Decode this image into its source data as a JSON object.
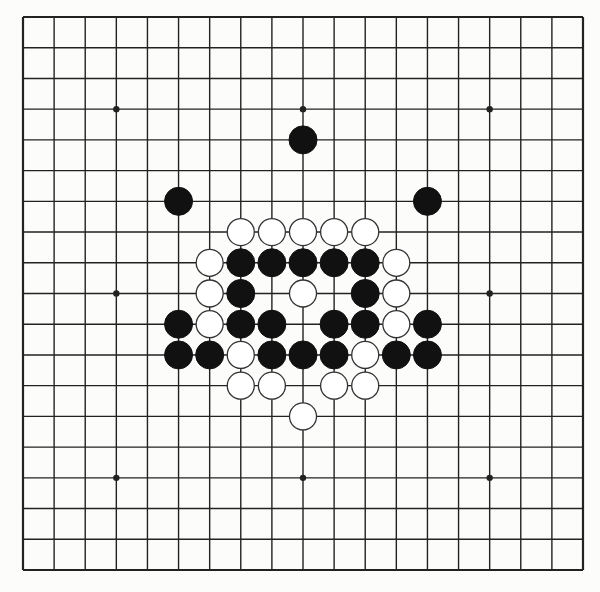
{
  "board": {
    "size": 19,
    "left": 23,
    "top": 17,
    "right": 583,
    "bottom": 570,
    "background": "#fcfcfb",
    "line_color": "#222222",
    "stone_black": "#111111",
    "stone_white": "#ffffff",
    "stone_outline": "#333333",
    "stone_radius": 14,
    "hoshi": [
      [
        3,
        3
      ],
      [
        9,
        3
      ],
      [
        15,
        3
      ],
      [
        3,
        9
      ],
      [
        9,
        9
      ],
      [
        15,
        9
      ],
      [
        3,
        15
      ],
      [
        9,
        15
      ],
      [
        15,
        15
      ]
    ]
  },
  "stones": {
    "black": [
      [
        9,
        4
      ],
      [
        5,
        6
      ],
      [
        13,
        6
      ],
      [
        7,
        8
      ],
      [
        8,
        8
      ],
      [
        9,
        8
      ],
      [
        10,
        8
      ],
      [
        11,
        8
      ],
      [
        7,
        9
      ],
      [
        11,
        9
      ],
      [
        5,
        10
      ],
      [
        7,
        10
      ],
      [
        8,
        10
      ],
      [
        10,
        10
      ],
      [
        11,
        10
      ],
      [
        13,
        10
      ],
      [
        5,
        11
      ],
      [
        6,
        11
      ],
      [
        8,
        11
      ],
      [
        9,
        11
      ],
      [
        10,
        11
      ],
      [
        12,
        11
      ],
      [
        13,
        11
      ]
    ],
    "white": [
      [
        7,
        7
      ],
      [
        8,
        7
      ],
      [
        9,
        7
      ],
      [
        10,
        7
      ],
      [
        11,
        7
      ],
      [
        6,
        8
      ],
      [
        12,
        8
      ],
      [
        6,
        9
      ],
      [
        9,
        9
      ],
      [
        12,
        9
      ],
      [
        6,
        10
      ],
      [
        12,
        10
      ],
      [
        7,
        11
      ],
      [
        11,
        11
      ],
      [
        7,
        12
      ],
      [
        8,
        12
      ],
      [
        10,
        12
      ],
      [
        11,
        12
      ],
      [
        9,
        13
      ]
    ]
  }
}
